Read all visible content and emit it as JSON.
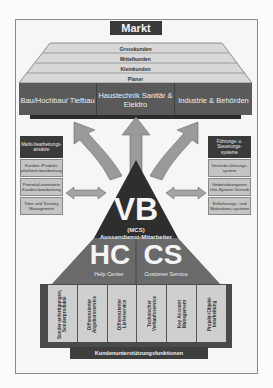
{
  "diagram": {
    "title": "Markt",
    "customer_tiers": [
      "Grosskunden",
      "Mittelkunden",
      "Kleinkunden",
      "Planer"
    ],
    "segments": [
      {
        "label": "Bau/Hochbau/ Tiefbau"
      },
      {
        "label": "Haustechnik Sanitär & Elektro"
      },
      {
        "label": "Industrie & Behörden"
      }
    ],
    "left_panel": {
      "header": "Markt-bearbeitungs-ansätze",
      "items": [
        "Kunden-/Produkt-plattform-bearbeitung",
        "Potential-orientierte Kunden-bearbeitung",
        "Time und Territory Management"
      ]
    },
    "right_panel": {
      "header": "Führungs- u. Steuerungs-systeme",
      "items": [
        "Vertriebs-führungs-system",
        "Gebietsbezogener Info-System Vertrieb",
        "Entlohnungs- und Motivations-systeme"
      ]
    },
    "apex": {
      "abbr": "VB",
      "sub1": "(MCS)",
      "sub2": "Aussendienst-Mitarbeiter"
    },
    "left_block": {
      "abbr": "HC",
      "label": "Help Center"
    },
    "right_block": {
      "abbr": "CS",
      "label": "Customer Service"
    },
    "support_functions": [
      "Sonder-anfertigungen, Sonderprodukte",
      "Differenzierter Angebotsservice",
      "Differenzierter Lieferservice",
      "Technischer Verkaufsservice",
      "Key Account Management",
      "Projekt-/Objekt-bearbeitung"
    ],
    "footer": "Kundenunterstützungsfunktionen",
    "colors": {
      "dark": "#3a3a3a",
      "mid": "#5a5a5a",
      "light": "#c4c4c4",
      "arrow": "#9a9a9a"
    }
  }
}
